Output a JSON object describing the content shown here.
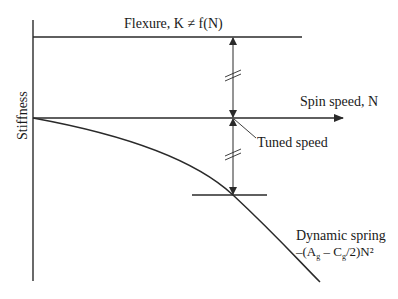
{
  "diagram": {
    "labels": {
      "y_axis": "Stiffness",
      "x_axis": "Spin speed, N",
      "flexure": "Flexure, K ≠ f(N)",
      "tuned_speed": "Tuned speed",
      "dynamic_spring_line1": "Dynamic spring",
      "dynamic_spring_line2_prefix": "–(A",
      "dynamic_spring_sub1": "g",
      "dynamic_spring_mid": " – C",
      "dynamic_spring_sub2": "g",
      "dynamic_spring_suffix": "/2)N²"
    },
    "elements": [
      {
        "name": "stiffness-axis",
        "kind": "axis"
      },
      {
        "name": "spin-speed-axis",
        "kind": "axis-with-arrow"
      },
      {
        "name": "flexure-stiffness-line",
        "kind": "constant-line"
      },
      {
        "name": "dynamic-spring-curve",
        "kind": "parabola-negative"
      },
      {
        "name": "upper-dimension-arrow",
        "kind": "double-arrow-with-break"
      },
      {
        "name": "lower-dimension-arrow",
        "kind": "double-arrow-with-break"
      },
      {
        "name": "tuned-speed-leader",
        "kind": "leader-line"
      }
    ],
    "colors": {
      "line": "#2a2a2a",
      "text": "#1a1a1a",
      "background": "#ffffff"
    }
  }
}
